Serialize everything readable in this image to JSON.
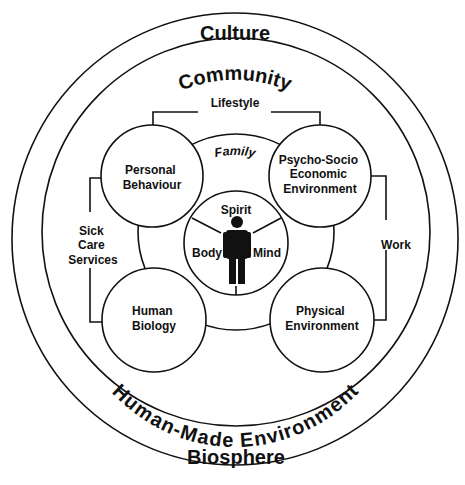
{
  "diagram": {
    "type": "mandala-of-health",
    "rings": {
      "outer_top": "Culture",
      "outer_bottom": "Biosphere",
      "inner_top": "Community",
      "inner_bottom": "Human-Made Environment"
    },
    "family_label": "Family",
    "determinants": [
      {
        "id": "personal-behaviour",
        "lines": [
          "Personal",
          "Behaviour"
        ]
      },
      {
        "id": "psycho-socio-economic",
        "lines": [
          "Psycho-Socio",
          "Economic",
          "Environment"
        ]
      },
      {
        "id": "human-biology",
        "lines": [
          "Human",
          "Biology"
        ]
      },
      {
        "id": "physical-environment",
        "lines": [
          "Physical",
          "Environment"
        ]
      }
    ],
    "connectors": {
      "top": "Lifestyle",
      "left": [
        "Sick",
        "Care",
        "Services"
      ],
      "right": "Work"
    },
    "core": {
      "top": "Spirit",
      "left": "Body",
      "right": "Mind",
      "icon": "person-icon"
    }
  }
}
